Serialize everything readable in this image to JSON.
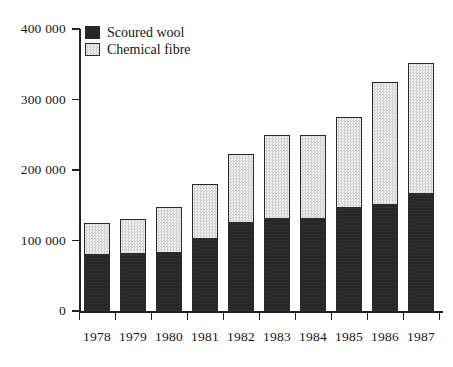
{
  "chart_data": {
    "type": "bar",
    "title": "",
    "subtitle": "",
    "xlabel": "",
    "ylabel": "",
    "stacked": true,
    "grid": false,
    "legend_position": "top-left",
    "categories": [
      "1978",
      "1979",
      "1980",
      "1981",
      "1982",
      "1983",
      "1984",
      "1985",
      "1986",
      "1987"
    ],
    "ylim": [
      0,
      400000
    ],
    "yticks": [
      0,
      100000,
      200000,
      300000,
      400000
    ],
    "ytick_labels": [
      "0",
      "100 000",
      "200 000",
      "300 000",
      "400 000"
    ],
    "series": [
      {
        "name": "Scoured wool",
        "color": "#262626",
        "values": [
          79000,
          81000,
          82000,
          102000,
          125000,
          130000,
          130000,
          146000,
          151000,
          166000
        ]
      },
      {
        "name": "Chemical fibre",
        "color": "#e2e2e2",
        "values": [
          46000,
          49000,
          66000,
          78000,
          98000,
          120000,
          120000,
          129000,
          174000,
          186000
        ]
      }
    ],
    "totals": [
      125000,
      130000,
      148000,
      180000,
      223000,
      250000,
      250000,
      275000,
      325000,
      352000
    ]
  },
  "legend": {
    "items": [
      {
        "label": "Scoured wool"
      },
      {
        "label": "Chemical fibre"
      }
    ]
  }
}
